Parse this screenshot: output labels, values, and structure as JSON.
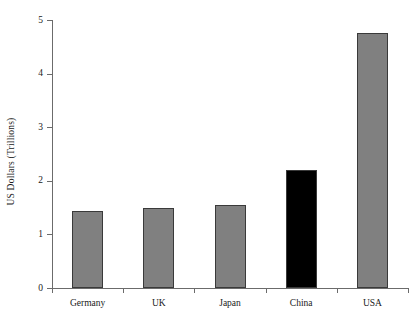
{
  "chart_data": {
    "type": "bar",
    "title": "",
    "xlabel": "",
    "ylabel": "US Dollars (Trillions)",
    "categories": [
      "Germany",
      "UK",
      "Japan",
      "China",
      "USA"
    ],
    "values": [
      1.43,
      1.5,
      1.55,
      2.2,
      4.75
    ],
    "series": [
      {
        "name": "GDP",
        "values": [
          1.43,
          1.5,
          1.55,
          2.2,
          4.75
        ]
      }
    ],
    "bar_colors": [
      "#808080",
      "#808080",
      "#808080",
      "#000000",
      "#808080"
    ],
    "ylim": [
      0,
      5
    ],
    "yticks": [
      0,
      1,
      2,
      3,
      4,
      5
    ],
    "ytick_labels": [
      "0",
      "1",
      "2",
      "3",
      "4",
      "5"
    ],
    "grid": false,
    "legend": null,
    "legend_position": "none",
    "annotations": [],
    "highlight_category": "China"
  },
  "style": {
    "axis_color": "#6b6b6b",
    "bar_gray": "#808080",
    "bar_black": "#000000",
    "bar_edge": "#3a3a3a",
    "background": "#ffffff",
    "text_color": "#1a1a1a"
  }
}
